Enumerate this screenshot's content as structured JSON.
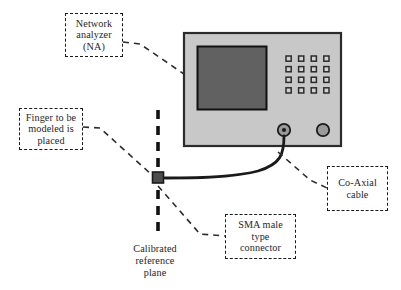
{
  "figure": {
    "type": "labeled-schematic"
  },
  "colors": {
    "background": "#ffffff",
    "device_body_fill": "#c8c8c8",
    "device_body_stroke": "#2b2b2b",
    "screen_fill": "#616161",
    "screen_stroke": "#111111",
    "button_fill": "#d2d2d2",
    "button_stroke": "#2b2b2b",
    "port_fill": "#9a9a9a",
    "port_stroke": "#1c1c1c",
    "cable_stroke": "#1a1a1a",
    "connector_fill": "#4d4d4d",
    "connector_stroke": "#1a1a1a",
    "reference_line": "#111111",
    "leader_line": "#2b2b2b",
    "text": "#262626"
  },
  "callouts": {
    "network_analyzer": {
      "name": "network-analyzer",
      "line1": "Network",
      "line2": "analyzer",
      "line3": "(NA)"
    },
    "finger": {
      "name": "finger-placement",
      "line1": "Finger to be",
      "line2": "modeled is",
      "line3": "placed"
    },
    "sma_connector": {
      "name": "sma-connector",
      "line1": "SMA male",
      "line2": "type",
      "line3": "connector"
    },
    "coaxial_cable": {
      "name": "coaxial-cable",
      "line1": "Co-Axial",
      "line2": "cable"
    },
    "reference_plane": {
      "name": "calibrated-reference-plane",
      "line1": "Calibrated",
      "line2": "reference",
      "line3": "plane"
    }
  },
  "device": {
    "name": "network-analyzer-device",
    "screen_label": "display-screen",
    "keypad_label": "keypad-button-grid",
    "keypad_rows": 4,
    "keypad_columns": 4,
    "port_left_label": "test-port-1",
    "port_right_label": "test-port-2"
  },
  "components": {
    "cable_label": "coaxial-cable-line",
    "connector_label": "sma-connector-block",
    "reference_line_label": "calibrated-reference-plane-line"
  }
}
